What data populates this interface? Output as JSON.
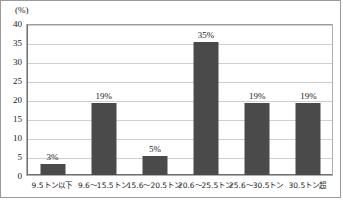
{
  "chart_data": {
    "type": "bar",
    "title": "",
    "xlabel": "",
    "ylabel": "",
    "unit_label": "(%)",
    "categories": [
      "9.5トン以下",
      "9.6〜15.5トン",
      "15.6〜20.5トン",
      "20.6〜25.5トン",
      "25.6〜30.5トン",
      "30.5トン超"
    ],
    "values": [
      3,
      19,
      5,
      35,
      19,
      19
    ],
    "value_labels": [
      "3%",
      "19%",
      "5%",
      "35%",
      "19%",
      "19%"
    ],
    "ylim": [
      0,
      40
    ],
    "ytick_values": [
      0,
      5,
      10,
      15,
      20,
      25,
      30,
      35,
      40
    ],
    "ytick_labels": [
      "0",
      "5",
      "10",
      "15",
      "20",
      "25",
      "30",
      "35",
      "40"
    ],
    "grid": true,
    "legend": "none",
    "bar_color": "#4a4a4a",
    "gridline_color": "#cfcfcf",
    "axis_color": "#6f6f6f",
    "background_color": "#ffffff"
  }
}
